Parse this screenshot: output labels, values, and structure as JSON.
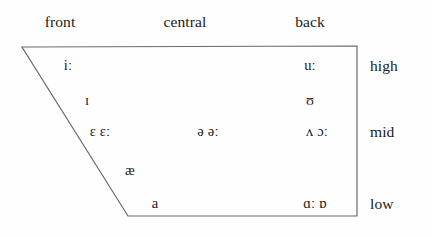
{
  "chart_data": {
    "type": "diagram",
    "axis_columns": [
      "front",
      "central",
      "back"
    ],
    "axis_rows": [
      "high",
      "mid",
      "low"
    ],
    "grid": false,
    "legend": "none",
    "shape": "trapezoid",
    "vowels": [
      {
        "symbol": "iː",
        "column": "front",
        "row": "high",
        "x": 68,
        "y": 65
      },
      {
        "symbol": "uː",
        "column": "back",
        "row": "high",
        "x": 310,
        "y": 65
      },
      {
        "symbol": "ɪ",
        "column": "front",
        "row": "near-high",
        "x": 87,
        "y": 100
      },
      {
        "symbol": "ʊ",
        "column": "back",
        "row": "near-high",
        "x": 310,
        "y": 100
      },
      {
        "symbol": "ɛ ɛː",
        "column": "front",
        "row": "mid",
        "x": 100,
        "y": 131
      },
      {
        "symbol": "ə əː",
        "column": "central",
        "row": "mid",
        "x": 208,
        "y": 131
      },
      {
        "symbol": "ʌ ɔː",
        "column": "back",
        "row": "mid",
        "x": 317,
        "y": 131
      },
      {
        "symbol": "æ",
        "column": "front",
        "row": "near-low",
        "x": 130,
        "y": 170
      },
      {
        "symbol": "a",
        "column": "front",
        "row": "low",
        "x": 155,
        "y": 203
      },
      {
        "symbol": "ɑː ɒ",
        "column": "back",
        "row": "low",
        "x": 315,
        "y": 203
      }
    ]
  },
  "headings": {
    "front": {
      "label": "front",
      "x": 60
    },
    "central": {
      "label": "central",
      "x": 185
    },
    "back": {
      "label": "back",
      "x": 310
    }
  },
  "row_labels": {
    "high": {
      "label": "high",
      "y": 58
    },
    "mid": {
      "label": "mid",
      "y": 124
    },
    "low": {
      "label": "low",
      "y": 196
    }
  },
  "outline": {
    "points": "22,47 357,46 357,216 128,216",
    "stroke": "#6b6b6b",
    "stroke_width": 1.2,
    "fill": "none"
  },
  "colors": {
    "background": "#fefefe",
    "text": "#1a1a1a",
    "line": "#6b6b6b"
  }
}
